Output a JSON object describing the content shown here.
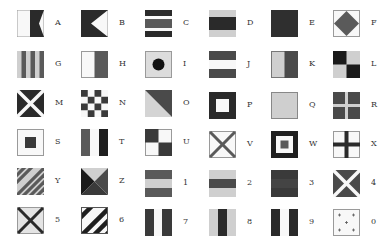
{
  "colors": {
    "dark": "#2a2a2a",
    "mid": "#5a5a5a",
    "light": "#cfcfcf",
    "white": "#f8f8f8",
    "border": "#9a9a9a"
  },
  "flags": [
    {
      "label": "A",
      "icon": "flag-a-icon"
    },
    {
      "label": "B",
      "icon": "flag-b-icon"
    },
    {
      "label": "C",
      "icon": "flag-c-icon"
    },
    {
      "label": "D",
      "icon": "flag-d-icon"
    },
    {
      "label": "E",
      "icon": "flag-e-icon"
    },
    {
      "label": "F",
      "icon": "flag-f-icon"
    },
    {
      "label": "G",
      "icon": "flag-g-icon"
    },
    {
      "label": "H",
      "icon": "flag-h-icon"
    },
    {
      "label": "I",
      "icon": "flag-i-icon"
    },
    {
      "label": "J",
      "icon": "flag-j-icon"
    },
    {
      "label": "K",
      "icon": "flag-k-icon"
    },
    {
      "label": "L",
      "icon": "flag-l-icon"
    },
    {
      "label": "M",
      "icon": "flag-m-icon"
    },
    {
      "label": "N",
      "icon": "flag-n-icon"
    },
    {
      "label": "O",
      "icon": "flag-o-icon"
    },
    {
      "label": "P",
      "icon": "flag-p-icon"
    },
    {
      "label": "Q",
      "icon": "flag-q-icon"
    },
    {
      "label": "R",
      "icon": "flag-r-icon"
    },
    {
      "label": "S",
      "icon": "flag-s-icon"
    },
    {
      "label": "T",
      "icon": "flag-t-icon"
    },
    {
      "label": "U",
      "icon": "flag-u-icon"
    },
    {
      "label": "V",
      "icon": "flag-v-icon"
    },
    {
      "label": "W",
      "icon": "flag-w-icon"
    },
    {
      "label": "X",
      "icon": "flag-x-icon"
    },
    {
      "label": "Y",
      "icon": "flag-y-icon"
    },
    {
      "label": "Z",
      "icon": "flag-z-icon"
    },
    {
      "label": "1",
      "icon": "flag-1-icon"
    },
    {
      "label": "2",
      "icon": "flag-2-icon"
    },
    {
      "label": "3",
      "icon": "flag-3-icon"
    },
    {
      "label": "4",
      "icon": "flag-4-icon"
    },
    {
      "label": "5",
      "icon": "flag-5-icon"
    },
    {
      "label": "6",
      "icon": "flag-6-icon"
    },
    {
      "label": "7",
      "icon": "flag-7-icon"
    },
    {
      "label": "8",
      "icon": "flag-8-icon"
    },
    {
      "label": "9",
      "icon": "flag-9-icon"
    },
    {
      "label": "0",
      "icon": "flag-0-icon"
    }
  ]
}
